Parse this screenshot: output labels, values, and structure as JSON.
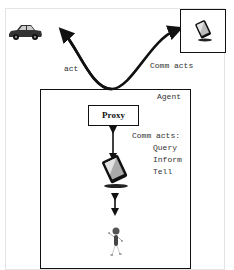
{
  "diagram": {
    "labels": {
      "act": "act",
      "comm_acts_top": "Comm acts",
      "agent": "Agent",
      "proxy": "Proxy",
      "comm_acts_list_title": "Comm acts:",
      "comm_acts_items": [
        "Query",
        "Inform",
        "Tell"
      ]
    },
    "nodes": [
      {
        "id": "car",
        "icon": "car-icon"
      },
      {
        "id": "remote-device",
        "icon": "tablet-icon"
      },
      {
        "id": "agent",
        "label": "Agent"
      },
      {
        "id": "proxy",
        "label": "Proxy"
      },
      {
        "id": "agent-device",
        "icon": "tablet-icon"
      },
      {
        "id": "user",
        "icon": "person-icon"
      }
    ],
    "edges": [
      {
        "from": "agent",
        "to": "car",
        "label": "act"
      },
      {
        "from": "agent",
        "to": "remote-device",
        "label": "Comm acts"
      },
      {
        "from": "proxy",
        "to": "agent-device",
        "bidirectional": true
      },
      {
        "from": "agent-device",
        "to": "user",
        "bidirectional": true
      }
    ],
    "colors": {
      "line": "#111111",
      "frame": "#e4e4e4",
      "text": "#333333"
    }
  }
}
